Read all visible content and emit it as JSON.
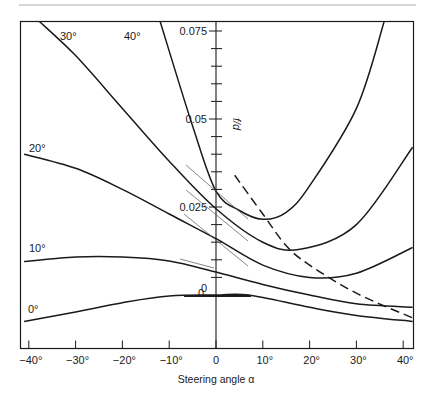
{
  "chart_data": {
    "type": "line",
    "title": "",
    "xlabel": "Steering angle α",
    "ylabel": "f/d",
    "xlim": [
      -42,
      42
    ],
    "ylim": [
      -0.012,
      0.078
    ],
    "grid": false,
    "x_ticks": [
      -40,
      -30,
      -20,
      -10,
      0,
      10,
      20,
      30,
      40
    ],
    "x_tick_labels": [
      "−40°",
      "−30°",
      "−20°",
      "−10°",
      "0",
      "10°",
      "20°",
      "30°",
      "40°"
    ],
    "y_tick_labels": [
      {
        "value": 0.075,
        "label": "0.075"
      },
      {
        "value": 0.05,
        "label": "0.05"
      },
      {
        "value": 0.025,
        "label": "0.025"
      },
      {
        "value": 0,
        "label": "0"
      }
    ],
    "series": [
      {
        "name": "0°",
        "label": "0°",
        "x": [
          -41,
          -30,
          -20,
          -10,
          0,
          7,
          20,
          30,
          42
        ],
        "y": [
          -0.0075,
          -0.0048,
          -0.0022,
          -0.0003,
          0.0,
          0.0,
          -0.0035,
          -0.0058,
          -0.0075
        ]
      },
      {
        "name": "10°",
        "label": "10°",
        "x": [
          -41,
          -30,
          -20,
          -10,
          0,
          10,
          20,
          30,
          42
        ],
        "y": [
          0.0095,
          0.0108,
          0.0108,
          0.0097,
          0.0065,
          0.003,
          0.0,
          -0.0025,
          -0.0035
        ]
      },
      {
        "name": "20°",
        "label": "20°",
        "x": [
          -41,
          -30,
          -20,
          -10,
          0,
          10,
          20,
          30,
          42
        ],
        "y": [
          0.04,
          0.036,
          0.03,
          0.023,
          0.016,
          0.0085,
          0.005,
          0.0062,
          0.0135
        ]
      },
      {
        "name": "30°",
        "label": "30°",
        "x": [
          -38,
          -30,
          -20,
          -10,
          0,
          10,
          18,
          30,
          42
        ],
        "y": [
          0.078,
          0.068,
          0.053,
          0.038,
          0.0245,
          0.015,
          0.013,
          0.02,
          0.042
        ]
      },
      {
        "name": "40°",
        "label": "40°",
        "x": [
          -12,
          -5,
          0,
          5,
          10,
          15,
          20,
          30,
          36
        ],
        "y": [
          0.078,
          0.048,
          0.0295,
          0.024,
          0.0215,
          0.0235,
          0.031,
          0.053,
          0.078
        ]
      },
      {
        "name": "locus (dashed)",
        "label": "",
        "x": [
          4,
          10,
          15,
          20,
          30,
          42
        ],
        "y": [
          0.034,
          0.023,
          0.014,
          0.0085,
          0.0005,
          -0.0065
        ],
        "style": "dashed"
      }
    ],
    "annotations": [
      {
        "text": "0",
        "x": -2,
        "y": 0.002
      },
      {
        "text": "tangent lines near α = 0 on 20°, 30°, 40° curves and 10° curve"
      }
    ],
    "legend": "inline curve labels at left"
  }
}
